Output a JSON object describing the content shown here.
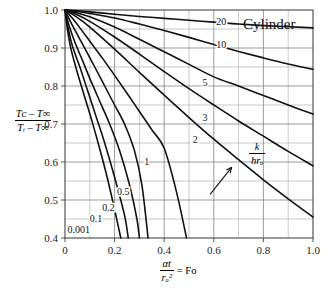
{
  "chart_data": {
    "type": "line",
    "title": "Cylinder",
    "xlabel": "αt/rₒ² = Fo",
    "ylabel": "(Tᴄ - T∞)/(Tᵢ - T∞)",
    "xlim": [
      0,
      1.0
    ],
    "ylim": [
      0.4,
      1.0
    ],
    "grid": true,
    "legend_position": "inline-curve-labels",
    "xticks": [
      "0",
      "0.2",
      "0.4",
      "0.6",
      "0.8",
      "1.0"
    ],
    "xtick_values": [
      0,
      0.2,
      0.4,
      0.6,
      0.8,
      1.0
    ],
    "yticks": [
      "0.4",
      "0.5",
      "0.6",
      "0.7",
      "0.8",
      "0.9",
      "1.0"
    ],
    "ytick_values": [
      0.4,
      0.5,
      0.6,
      0.7,
      0.8,
      0.9,
      1.0
    ],
    "x_minor_step": 0.1,
    "y_minor_step": 0.05,
    "annotation": {
      "text": "k/hrₒ",
      "numerator": "k",
      "denominator": "hrₒ",
      "arrow_from": [
        0.585,
        0.515
      ],
      "arrow_to": [
        0.672,
        0.586
      ]
    },
    "series": [
      {
        "name": "20",
        "label": "20",
        "points": [
          [
            0,
            1.0
          ],
          [
            0.05,
            0.998
          ],
          [
            0.1,
            0.995
          ],
          [
            0.2,
            0.989
          ],
          [
            0.3,
            0.983
          ],
          [
            0.4,
            0.978
          ],
          [
            0.5,
            0.973
          ],
          [
            0.6,
            0.968
          ],
          [
            0.7,
            0.963
          ],
          [
            0.8,
            0.959
          ],
          [
            0.9,
            0.956
          ],
          [
            1.0,
            0.953
          ]
        ]
      },
      {
        "name": "10",
        "label": "10",
        "points": [
          [
            0,
            1.0
          ],
          [
            0.05,
            0.996
          ],
          [
            0.1,
            0.991
          ],
          [
            0.2,
            0.979
          ],
          [
            0.3,
            0.963
          ],
          [
            0.4,
            0.946
          ],
          [
            0.5,
            0.928
          ],
          [
            0.6,
            0.909
          ],
          [
            0.7,
            0.891
          ],
          [
            0.8,
            0.874
          ],
          [
            0.9,
            0.858
          ],
          [
            1.0,
            0.844
          ]
        ]
      },
      {
        "name": "5",
        "label": "5",
        "points": [
          [
            0,
            1.0
          ],
          [
            0.05,
            0.992
          ],
          [
            0.1,
            0.982
          ],
          [
            0.2,
            0.955
          ],
          [
            0.3,
            0.923
          ],
          [
            0.4,
            0.89
          ],
          [
            0.5,
            0.857
          ],
          [
            0.6,
            0.824
          ],
          [
            0.7,
            0.8
          ],
          [
            0.8,
            0.775
          ],
          [
            0.9,
            0.75
          ],
          [
            1.0,
            0.726
          ]
        ]
      },
      {
        "name": "3",
        "label": "3",
        "points": [
          [
            0,
            1.0
          ],
          [
            0.05,
            0.987
          ],
          [
            0.1,
            0.97
          ],
          [
            0.2,
            0.929
          ],
          [
            0.3,
            0.884
          ],
          [
            0.4,
            0.838
          ],
          [
            0.5,
            0.793
          ],
          [
            0.6,
            0.75
          ],
          [
            0.7,
            0.708
          ],
          [
            0.8,
            0.668
          ],
          [
            0.9,
            0.628
          ],
          [
            1.0,
            0.59
          ]
        ]
      },
      {
        "name": "2",
        "label": "2",
        "points": [
          [
            0,
            1.0
          ],
          [
            0.05,
            0.98
          ],
          [
            0.1,
            0.955
          ],
          [
            0.2,
            0.897
          ],
          [
            0.3,
            0.836
          ],
          [
            0.4,
            0.776
          ],
          [
            0.5,
            0.717
          ],
          [
            0.6,
            0.66
          ],
          [
            0.7,
            0.606
          ],
          [
            0.8,
            0.553
          ],
          [
            0.9,
            0.503
          ],
          [
            1.0,
            0.455
          ]
        ]
      },
      {
        "name": "1",
        "label": "1",
        "points": [
          [
            0,
            1.0
          ],
          [
            0.03,
            0.978
          ],
          [
            0.06,
            0.953
          ],
          [
            0.1,
            0.918
          ],
          [
            0.15,
            0.874
          ],
          [
            0.2,
            0.828
          ],
          [
            0.25,
            0.781
          ],
          [
            0.3,
            0.733
          ],
          [
            0.35,
            0.685
          ],
          [
            0.4,
            0.636
          ],
          [
            0.45,
            0.52
          ],
          [
            0.49,
            0.4
          ]
        ]
      },
      {
        "name": "0.5",
        "label": "0.5",
        "points": [
          [
            0,
            1.0
          ],
          [
            0.02,
            0.972
          ],
          [
            0.05,
            0.935
          ],
          [
            0.08,
            0.899
          ],
          [
            0.12,
            0.85
          ],
          [
            0.16,
            0.8
          ],
          [
            0.2,
            0.75
          ],
          [
            0.24,
            0.7
          ],
          [
            0.28,
            0.63
          ],
          [
            0.31,
            0.54
          ],
          [
            0.335,
            0.4
          ]
        ]
      },
      {
        "name": "0.2",
        "label": "0.2",
        "points": [
          [
            0,
            1.0
          ],
          [
            0.015,
            0.962
          ],
          [
            0.04,
            0.915
          ],
          [
            0.07,
            0.868
          ],
          [
            0.1,
            0.82
          ],
          [
            0.14,
            0.76
          ],
          [
            0.18,
            0.7
          ],
          [
            0.22,
            0.63
          ],
          [
            0.26,
            0.54
          ],
          [
            0.29,
            0.45
          ],
          [
            0.3,
            0.4
          ]
        ]
      },
      {
        "name": "0.1",
        "label": "0.1",
        "points": [
          [
            0,
            1.0
          ],
          [
            0.012,
            0.955
          ],
          [
            0.03,
            0.905
          ],
          [
            0.06,
            0.85
          ],
          [
            0.09,
            0.79
          ],
          [
            0.12,
            0.73
          ],
          [
            0.16,
            0.65
          ],
          [
            0.2,
            0.56
          ],
          [
            0.24,
            0.46
          ],
          [
            0.255,
            0.4
          ]
        ]
      },
      {
        "name": "0.001",
        "label": "0.001",
        "points": [
          [
            0,
            1.0
          ],
          [
            0.01,
            0.948
          ],
          [
            0.025,
            0.895
          ],
          [
            0.05,
            0.835
          ],
          [
            0.08,
            0.77
          ],
          [
            0.11,
            0.705
          ],
          [
            0.14,
            0.635
          ],
          [
            0.17,
            0.56
          ],
          [
            0.2,
            0.475
          ],
          [
            0.225,
            0.4
          ]
        ]
      }
    ],
    "curve_label_positions": [
      {
        "label": "20",
        "x": 0.63,
        "y": 0.967
      },
      {
        "label": "10",
        "x": 0.63,
        "y": 0.906
      },
      {
        "label": "5",
        "x": 0.565,
        "y": 0.805
      },
      {
        "label": "3",
        "x": 0.565,
        "y": 0.715
      },
      {
        "label": "2",
        "x": 0.525,
        "y": 0.655
      },
      {
        "label": "1",
        "x": 0.33,
        "y": 0.598
      },
      {
        "label": "0.5",
        "x": 0.235,
        "y": 0.52
      },
      {
        "label": "0.2",
        "x": 0.175,
        "y": 0.478
      },
      {
        "label": "0.1",
        "x": 0.125,
        "y": 0.448
      },
      {
        "label": "0.001",
        "x": 0.055,
        "y": 0.42
      }
    ],
    "colors": {
      "curve": "#111111",
      "grid": "#8c8c8c",
      "axis": "#555555",
      "text": "#111111"
    }
  },
  "axis": {
    "y_numerator": "Tᴄ – T∞",
    "y_denominator": "Tᵢ – T∞",
    "x_numerator": "αt",
    "x_denominator": "rₒ²",
    "x_equals": "= Fo"
  },
  "title": "Cylinder"
}
